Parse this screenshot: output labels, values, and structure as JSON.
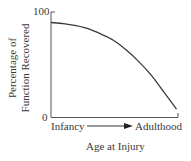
{
  "chart_data": {
    "type": "line",
    "title": "",
    "xlabel": "Age at Injury",
    "ylabel": "Percentage of Function Recovered",
    "ylabel_lines": [
      "Percentage of",
      "Function Recovered"
    ],
    "x_tick_labels": [
      "Infancy",
      "Adulthood"
    ],
    "x_arrow": "Infancy → Adulthood",
    "y_ticks": [
      0,
      100
    ],
    "ylim": [
      0,
      100
    ],
    "grid": false,
    "legend": null,
    "series": [
      {
        "name": "Function recovered",
        "x": [
          0,
          0.1,
          0.2,
          0.3,
          0.4,
          0.5,
          0.6,
          0.7,
          0.8,
          0.9,
          1.0
        ],
        "values": [
          90,
          89,
          87,
          84,
          79,
          73,
          64,
          53,
          40,
          24,
          8
        ]
      }
    ],
    "colors": {
      "line": "#3a3a3a",
      "axis": "#555555"
    }
  },
  "labels": {
    "y_top": "100",
    "y_bottom": "0",
    "x_left": "Infancy",
    "x_right": "Adulthood",
    "x_title": "Age at Injury",
    "y_title_line1": "Percentage of",
    "y_title_line2": "Function Recovered"
  }
}
